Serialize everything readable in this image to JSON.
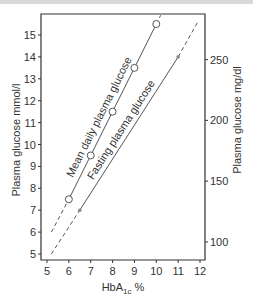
{
  "chart_data": {
    "type": "line",
    "title": "",
    "xlabel": "HbA1c %",
    "xlabel_main": "HbA",
    "xlabel_sub": "1c",
    "xlabel_suffix": " %",
    "ylabel": "Plasma glucose mmol/l",
    "ylabel_right": "Plasma glucose mg/dl",
    "xlim": [
      4.8,
      12.2
    ],
    "ylim": [
      4.7,
      15.9
    ],
    "x_ticks": [
      5,
      6,
      7,
      8,
      9,
      10,
      11,
      12
    ],
    "y_ticks": [
      5,
      6,
      7,
      8,
      9,
      10,
      11,
      12,
      13,
      14,
      15
    ],
    "y_right_ticks": [
      100,
      150,
      200,
      250
    ],
    "grid": false,
    "series": [
      {
        "name": "Mean daily plasma glucose",
        "marker": "open-circle",
        "x": [
          6,
          7,
          8,
          9,
          10
        ],
        "values": [
          7.5,
          9.5,
          11.5,
          13.5,
          15.5
        ],
        "dashed_extension": [
          [
            5.2,
            6.0
          ],
          [
            6.0,
            7.5
          ],
          [
            10.0,
            15.5
          ],
          [
            10.2,
            15.9
          ]
        ]
      },
      {
        "name": "Fasting plasma glucose",
        "marker": "small-dot",
        "x": [
          6.5,
          11
        ],
        "values": [
          7.0,
          14.0
        ],
        "dashed_extension": [
          [
            5.2,
            5.0
          ],
          [
            6.5,
            7.0
          ],
          [
            11.0,
            14.0
          ],
          [
            11.9,
            15.6
          ]
        ]
      }
    ]
  },
  "labels": {
    "mean": "Mean daily plasma glucose",
    "fasting": "Fasting plasma glucose"
  },
  "colors": {
    "axis": "#333333",
    "line": "#555555",
    "marker_fill": "#ffffff"
  }
}
